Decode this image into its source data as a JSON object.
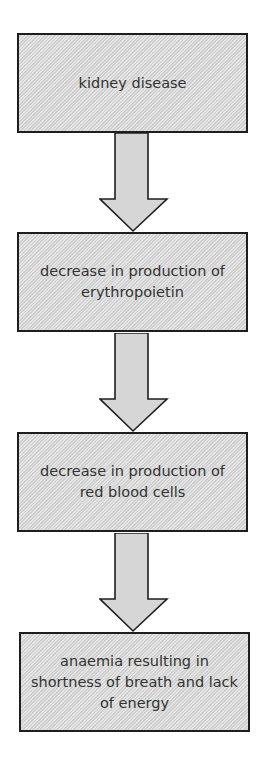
{
  "flowchart": {
    "steps": [
      {
        "label": "kidney disease"
      },
      {
        "label": "decrease in production of erythropoietin"
      },
      {
        "label": "decrease in production of red blood cells"
      },
      {
        "label": "anaemia resulting in shortness of breath and lack of energy"
      }
    ],
    "arrow_icon": "down-arrow-icon",
    "colors": {
      "box_fill": "#d9d9d9",
      "border": "#1e1e1e",
      "text": "#333333"
    }
  }
}
